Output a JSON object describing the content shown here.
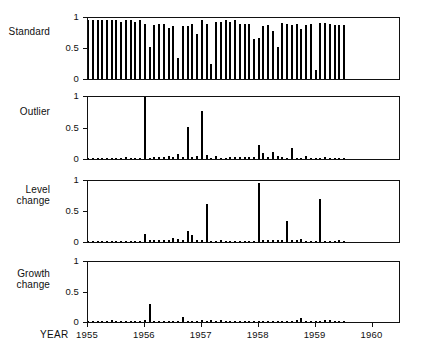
{
  "figure": {
    "x_axis_title": "YEAR",
    "y_ticks": [
      "0",
      "0.5",
      "1"
    ],
    "year_ticks": [
      "1955",
      "1956",
      "1957",
      "1958",
      "1959",
      "1960"
    ],
    "panel_labels": {
      "standard": "Standard",
      "outlier": "Outlier",
      "level_change": "Level\nchange",
      "growth_change": "Growth\nchange"
    },
    "colors": {
      "bar": "#000000",
      "frame": "#111111",
      "background": "#ffffff",
      "text": "#101010"
    }
  },
  "chart_data": [
    {
      "type": "bar",
      "title": "Standard",
      "xlabel": "YEAR",
      "ylabel": "",
      "ylim": [
        0,
        1
      ],
      "xlim": [
        1955.0,
        1960.5
      ],
      "grid": false,
      "legend": null,
      "yticks": [
        0,
        0.5,
        1
      ],
      "xticks": [
        1955,
        1956,
        1957,
        1958,
        1959,
        1960
      ],
      "x": [
        1955.0,
        1955.083,
        1955.167,
        1955.25,
        1955.333,
        1955.417,
        1955.5,
        1955.583,
        1955.667,
        1955.75,
        1955.833,
        1955.917,
        1956.0,
        1956.083,
        1956.167,
        1956.25,
        1956.333,
        1956.417,
        1956.5,
        1956.583,
        1956.667,
        1956.75,
        1956.833,
        1956.917,
        1957.0,
        1957.083,
        1957.167,
        1957.25,
        1957.333,
        1957.417,
        1957.5,
        1957.583,
        1957.667,
        1957.75,
        1957.833,
        1957.917,
        1958.0,
        1958.083,
        1958.167,
        1958.25,
        1958.333,
        1958.417,
        1958.5,
        1958.583,
        1958.667,
        1958.75,
        1958.833,
        1958.917,
        1959.0,
        1959.083,
        1959.167,
        1959.25,
        1959.333,
        1959.417,
        1959.5
      ],
      "values": [
        0.97,
        0.97,
        0.97,
        0.97,
        0.97,
        0.97,
        0.96,
        0.93,
        0.96,
        0.96,
        0.94,
        0.97,
        0.91,
        0.53,
        0.88,
        0.91,
        0.9,
        0.84,
        0.87,
        0.34,
        0.87,
        0.87,
        0.91,
        0.73,
        0.96,
        0.91,
        0.25,
        0.94,
        0.93,
        0.96,
        0.94,
        0.96,
        0.9,
        0.9,
        0.9,
        0.66,
        0.67,
        0.87,
        0.89,
        0.78,
        0.52,
        0.92,
        0.9,
        0.88,
        0.9,
        0.82,
        0.88,
        0.9,
        0.14,
        0.92,
        0.92,
        0.9,
        0.88,
        0.88,
        0.88
      ]
    },
    {
      "type": "bar",
      "title": "Outlier",
      "xlabel": "YEAR",
      "ylabel": "",
      "ylim": [
        0,
        1
      ],
      "xlim": [
        1955.0,
        1960.5
      ],
      "grid": false,
      "legend": null,
      "yticks": [
        0,
        0.5,
        1
      ],
      "xticks": [
        1955,
        1956,
        1957,
        1958,
        1959,
        1960
      ],
      "x": [
        1955.0,
        1955.083,
        1955.167,
        1955.25,
        1955.333,
        1955.417,
        1955.5,
        1955.583,
        1955.667,
        1955.75,
        1955.833,
        1955.917,
        1956.0,
        1956.083,
        1956.167,
        1956.25,
        1956.333,
        1956.417,
        1956.5,
        1956.583,
        1956.667,
        1956.75,
        1956.833,
        1956.917,
        1957.0,
        1957.083,
        1957.167,
        1957.25,
        1957.333,
        1957.417,
        1957.5,
        1957.583,
        1957.667,
        1957.75,
        1957.833,
        1957.917,
        1958.0,
        1958.083,
        1958.167,
        1958.25,
        1958.333,
        1958.417,
        1958.5,
        1958.583,
        1958.667,
        1958.75,
        1958.833,
        1958.917,
        1959.0,
        1959.083,
        1959.167,
        1959.25,
        1959.333,
        1959.417,
        1959.5
      ],
      "values": [
        0.01,
        0.01,
        0.01,
        0.01,
        0.01,
        0.01,
        0.02,
        0.02,
        0.03,
        0.01,
        0.01,
        0.01,
        1.0,
        0.02,
        0.03,
        0.03,
        0.04,
        0.05,
        0.03,
        0.08,
        0.03,
        0.52,
        0.04,
        0.05,
        0.77,
        0.06,
        0.02,
        0.05,
        0.02,
        0.02,
        0.03,
        0.03,
        0.03,
        0.04,
        0.03,
        0.03,
        0.22,
        0.1,
        0.03,
        0.12,
        0.05,
        0.03,
        0.02,
        0.17,
        0.02,
        0.02,
        0.05,
        0.02,
        0.02,
        0.02,
        0.03,
        0.01,
        0.01,
        0.01,
        0.01
      ]
    },
    {
      "type": "bar",
      "title": "Level change",
      "xlabel": "YEAR",
      "ylabel": "",
      "ylim": [
        0,
        1
      ],
      "xlim": [
        1955.0,
        1960.5
      ],
      "grid": false,
      "legend": null,
      "yticks": [
        0,
        0.5,
        1
      ],
      "xticks": [
        1955,
        1956,
        1957,
        1958,
        1959,
        1960
      ],
      "x": [
        1955.0,
        1955.083,
        1955.167,
        1955.25,
        1955.333,
        1955.417,
        1955.5,
        1955.583,
        1955.667,
        1955.75,
        1955.833,
        1955.917,
        1956.0,
        1956.083,
        1956.167,
        1956.25,
        1956.333,
        1956.417,
        1956.5,
        1956.583,
        1956.667,
        1956.75,
        1956.833,
        1956.917,
        1957.0,
        1957.083,
        1957.167,
        1957.25,
        1957.333,
        1957.417,
        1957.5,
        1957.583,
        1957.667,
        1957.75,
        1957.833,
        1957.917,
        1958.0,
        1958.083,
        1958.167,
        1958.25,
        1958.333,
        1958.417,
        1958.5,
        1958.583,
        1958.667,
        1958.75,
        1958.833,
        1958.917,
        1959.0,
        1959.083,
        1959.167,
        1959.25,
        1959.333,
        1959.417,
        1959.5
      ],
      "values": [
        0.01,
        0.01,
        0.01,
        0.01,
        0.02,
        0.02,
        0.02,
        0.02,
        0.02,
        0.02,
        0.02,
        0.02,
        0.13,
        0.04,
        0.03,
        0.03,
        0.04,
        0.03,
        0.06,
        0.05,
        0.03,
        0.18,
        0.11,
        0.03,
        0.03,
        0.63,
        0.02,
        0.02,
        0.03,
        0.02,
        0.02,
        0.02,
        0.02,
        0.02,
        0.02,
        0.02,
        0.96,
        0.03,
        0.04,
        0.04,
        0.03,
        0.03,
        0.34,
        0.03,
        0.03,
        0.05,
        0.02,
        0.02,
        0.02,
        0.71,
        0.02,
        0.02,
        0.02,
        0.04,
        0.01
      ]
    },
    {
      "type": "bar",
      "title": "Growth change",
      "xlabel": "YEAR",
      "ylabel": "",
      "ylim": [
        0,
        1
      ],
      "xlim": [
        1955.0,
        1960.5
      ],
      "grid": false,
      "legend": null,
      "yticks": [
        0,
        0.5,
        1
      ],
      "xticks": [
        1955,
        1956,
        1957,
        1958,
        1959,
        1960
      ],
      "x": [
        1955.0,
        1955.083,
        1955.167,
        1955.25,
        1955.333,
        1955.417,
        1955.5,
        1955.583,
        1955.667,
        1955.75,
        1955.833,
        1955.917,
        1956.0,
        1956.083,
        1956.167,
        1956.25,
        1956.333,
        1956.417,
        1956.5,
        1956.583,
        1956.667,
        1956.75,
        1956.833,
        1956.917,
        1957.0,
        1957.083,
        1957.167,
        1957.25,
        1957.333,
        1957.417,
        1957.5,
        1957.583,
        1957.667,
        1957.75,
        1957.833,
        1957.917,
        1958.0,
        1958.083,
        1958.167,
        1958.25,
        1958.333,
        1958.417,
        1958.5,
        1958.583,
        1958.667,
        1958.75,
        1958.833,
        1958.917,
        1959.0,
        1959.083,
        1959.167,
        1959.25,
        1959.333,
        1959.417,
        1959.5
      ],
      "values": [
        0.005,
        0.005,
        0.005,
        0.005,
        0.01,
        0.03,
        0.01,
        0.01,
        0.01,
        0.01,
        0.01,
        0.02,
        0.04,
        0.3,
        0.02,
        0.01,
        0.01,
        0.01,
        0.01,
        0.01,
        0.09,
        0.02,
        0.02,
        0.02,
        0.03,
        0.02,
        0.04,
        0.02,
        0.03,
        0.01,
        0.01,
        0.005,
        0.005,
        0.005,
        0.005,
        0.005,
        0.005,
        0.01,
        0.01,
        0.02,
        0.02,
        0.02,
        0.02,
        0.02,
        0.03,
        0.07,
        0.01,
        0.01,
        0.01,
        0.02,
        0.04,
        0.04,
        0.01,
        0.02,
        0.01
      ]
    }
  ]
}
